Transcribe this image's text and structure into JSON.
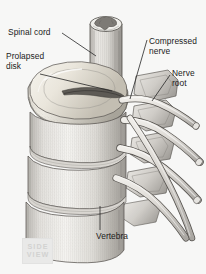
{
  "figure": {
    "background_color": "#f7f7f6",
    "illustration_style": "grayscale pencil / engraving medical illustration",
    "width": 206,
    "height": 274
  },
  "labels": {
    "spinal_cord": "Spinal cord",
    "prolapsed_disk": "Prolapsed\ndisk",
    "compressed_nerve": "Compressed\nnerve",
    "nerve_root": "Nerve\nroot",
    "vertebra": "Vertebra"
  },
  "badge": {
    "line1": "SIDE",
    "line2": "VIEW",
    "fill_color": "#e9e9e8",
    "text_color": "#d2d2d1"
  },
  "colors": {
    "text": "#1c1c1c",
    "leader_line": "#262626",
    "bone_light": "#f2f1ef",
    "bone_mid": "#cfcdc9",
    "bone_shadow": "#9a9792",
    "outline": "#4a4845",
    "disk_tint": "#e8e2d6",
    "disk_dark": "#5d5a55",
    "nerve_fill": "#dedbd6",
    "cord_gray_matter": "#7d7a75"
  },
  "structures": [
    {
      "name": "spinal-cord",
      "description": "vertical cylinder with butterfly-shaped gray matter cross-section at cut top end"
    },
    {
      "name": "prolapsed-disk",
      "description": "bulging intervertebral disk with concave superior surface and dark herniated crescent"
    },
    {
      "name": "vertebral-bodies",
      "description": "stack of four drum-shaped vertebral bodies with vertical hatching"
    },
    {
      "name": "nerve-roots",
      "description": "paired tubular nerve roots exiting laterally to the lower right"
    },
    {
      "name": "compressed-nerve",
      "description": "nerve root pinched beneath the prolapsed disk"
    },
    {
      "name": "facet-processes",
      "description": "posterior articular processes along the right margin"
    }
  ]
}
